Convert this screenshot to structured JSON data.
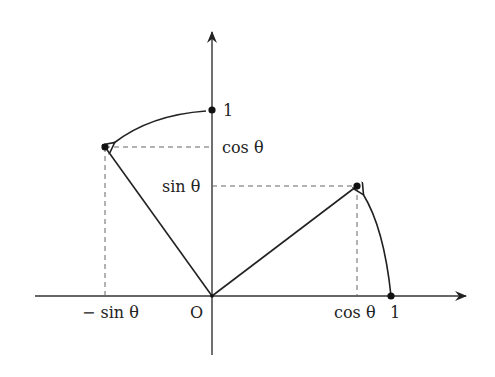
{
  "diagram": {
    "title": "",
    "colors": {
      "stroke": "#222222",
      "dashed": "#555555",
      "background": "#ffffff"
    },
    "labels": {
      "origin": "O",
      "x_one": "1",
      "y_one": "1",
      "cos_x": "cos θ",
      "cos_y": "cos θ",
      "sin_y": "sin θ",
      "neg_sin_x": "− sin θ"
    },
    "points": [
      {
        "name": "unit-x",
        "coords": "(1, 0)"
      },
      {
        "name": "unit-y",
        "coords": "(0, 1)"
      },
      {
        "name": "rotated-unit-x",
        "coords": "(cos θ, sin θ)"
      },
      {
        "name": "rotated-unit-y",
        "coords": "(− sin θ, cos θ)"
      }
    ]
  }
}
